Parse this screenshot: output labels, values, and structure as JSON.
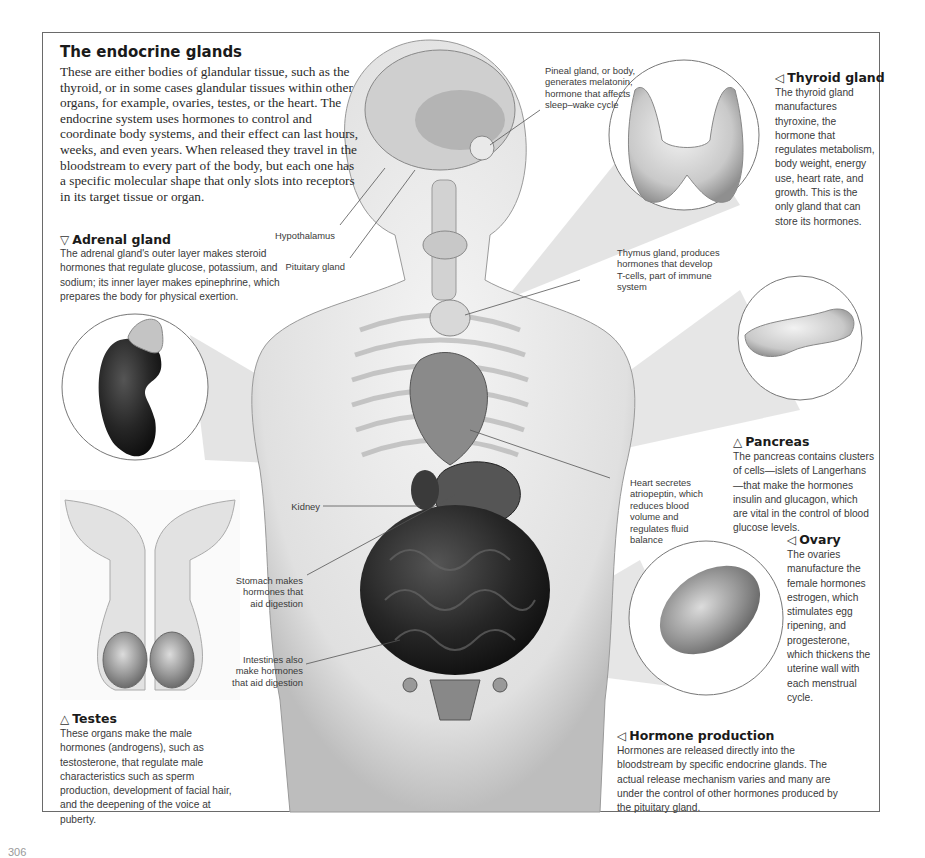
{
  "page": {
    "page_number": "306"
  },
  "intro": {
    "title": "The endocrine glands",
    "text": "These are either bodies of glandular tissue, such as the thyroid, or in some cases glandular tissues within other organs, for example, ovaries, testes, or the heart. The endocrine system uses hormones to control and coordinate body systems, and their effect can last hours, weeks, and even years. When released they travel in the bloodstream to every part of the body, but each one has a specific molecular shape that only slots into receptors in its target tissue or organ."
  },
  "sections": {
    "adrenal": {
      "pointer": "▽",
      "title": "Adrenal gland",
      "text": "The adrenal gland's outer layer makes steroid hormones that regulate glucose, potassium, and sodium; its inner layer makes epinephrine, which prepares the body for physical exertion."
    },
    "thyroid": {
      "pointer": "◁",
      "title": "Thyroid gland",
      "text": "The thyroid gland manufactures thyroxine, the hormone that regulates metabolism, body weight, energy use, heart rate, and growth. This is the only gland that can store its hormones."
    },
    "pancreas": {
      "pointer": "△",
      "title": "Pancreas",
      "text": "The pancreas contains clusters of cells—islets of Langerhans—that make the hormones insulin and glucagon, which are vital in the control of blood glucose levels."
    },
    "ovary": {
      "pointer": "◁",
      "title": "Ovary",
      "text": "The ovaries manufacture the female hormones estrogen, which stimulates egg ripening, and progesterone, which thickens the uterine wall with each menstrual cycle."
    },
    "hormone_production": {
      "pointer": "◁",
      "title": "Hormone production",
      "text": "Hormones are released directly into the bloodstream by specific endocrine glands. The actual release mechanism varies and many are under the control of other hormones produced by the pituitary gland."
    },
    "testes": {
      "pointer": "△",
      "title": "Testes",
      "text": "These organs make the male hormones (androgens), such as testosterone, that regulate male characteristics such as sperm production, development of facial hair, and the deepening of the voice at puberty."
    }
  },
  "labels": {
    "pineal": "Pineal gland, or body, generates melatonin, hormone that affects sleep–wake cycle",
    "hypothalamus": "Hypothalamus",
    "pituitary": "Pituitary gland",
    "thymus": "Thymus gland, produces hormones that develop T-cells, part of immune system",
    "heart": "Heart secretes atriopeptin, which reduces blood volume and regulates fluid balance",
    "kidney": "Kidney",
    "stomach": "Stomach makes hormones that aid digestion",
    "intestines": "Intestines also make hormones that aid digestion"
  },
  "colors": {
    "frame": "#6a6a6a",
    "text": "#2b2b2b",
    "beam": "#d9d9d9",
    "organ_dark": "#1e1e1e",
    "body_light": "#e6e6e6"
  }
}
